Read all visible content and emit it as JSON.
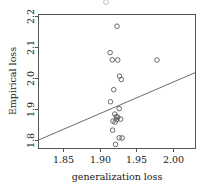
{
  "chart_data": {
    "type": "scatter",
    "title": "",
    "xlabel": "generalization loss",
    "ylabel": "Empirical loss",
    "xlim": [
      1.8125,
      2.0285
    ],
    "ylim": [
      1.785,
      2.212
    ],
    "xticks": [
      1.85,
      1.9,
      1.95,
      2.0
    ],
    "xticklabels": [
      "1.85",
      "1.90",
      "1.95",
      "2.00"
    ],
    "yticks": [
      1.8,
      1.9,
      2.0,
      2.1,
      2.2
    ],
    "yticklabels": [
      "1.8",
      "1.9",
      "2.0",
      "2.1",
      "2.2"
    ],
    "grid": false,
    "legend": null,
    "marker": "open-circle",
    "points": [
      {
        "x": 1.9205,
        "y": 2.1745
      },
      {
        "x": 1.911,
        "y": 2.09
      },
      {
        "x": 1.914,
        "y": 2.067
      },
      {
        "x": 1.9215,
        "y": 2.0665
      },
      {
        "x": 1.9755,
        "y": 2.0665
      },
      {
        "x": 1.924,
        "y": 2.015
      },
      {
        "x": 1.9265,
        "y": 2.004
      },
      {
        "x": 1.916,
        "y": 1.9715
      },
      {
        "x": 1.9115,
        "y": 1.933
      },
      {
        "x": 1.9235,
        "y": 1.911
      },
      {
        "x": 1.9175,
        "y": 1.8935
      },
      {
        "x": 1.9195,
        "y": 1.885
      },
      {
        "x": 1.9215,
        "y": 1.8835
      },
      {
        "x": 1.9255,
        "y": 1.8775
      },
      {
        "x": 1.92,
        "y": 1.876
      },
      {
        "x": 1.915,
        "y": 1.871
      },
      {
        "x": 1.918,
        "y": 1.868
      },
      {
        "x": 1.9145,
        "y": 1.842
      },
      {
        "x": 1.9235,
        "y": 1.8175
      },
      {
        "x": 1.9275,
        "y": 1.817
      },
      {
        "x": 1.9185,
        "y": 1.7965
      }
    ],
    "fit_line": {
      "type": "linear-regression",
      "x_start": 1.8125,
      "y_start": 1.8105,
      "x_end": 2.0285,
      "y_end": 2.0265
    }
  }
}
